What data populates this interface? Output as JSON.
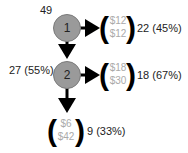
{
  "colors": {
    "node_fill": "#9a9a9a",
    "node_stroke": "#777777",
    "arrow": "#000000",
    "cost_text": "#aaaaaa",
    "label_text": "#222222"
  },
  "nodes": [
    {
      "id": "1",
      "label": "1",
      "count_label": "49"
    },
    {
      "id": "2",
      "label": "2",
      "count_label": "27 (55%)"
    }
  ],
  "outcomes": [
    {
      "from": "1",
      "top_cost": "$12",
      "bottom_cost": "$12",
      "count_label": "22 (45%)"
    },
    {
      "from": "2",
      "top_cost": "$18",
      "bottom_cost": "$30",
      "count_label": "18 (67%)"
    },
    {
      "from": "2",
      "top_cost": "$6",
      "bottom_cost": "$42",
      "count_label": "9 (33%)"
    }
  ],
  "brackets": {
    "open": "(",
    "close": ")"
  }
}
